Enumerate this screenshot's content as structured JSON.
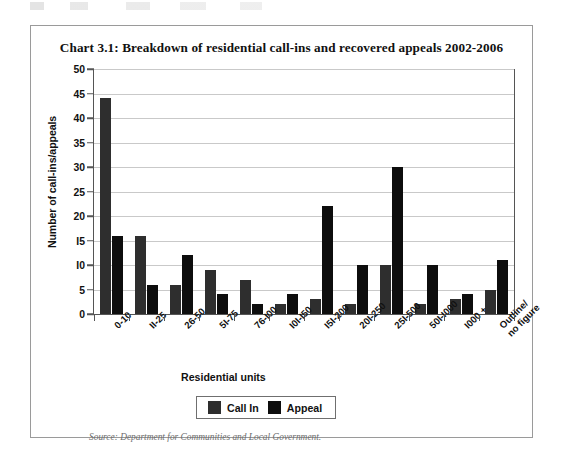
{
  "chart_data": {
    "type": "bar",
    "title": "Chart 3.1: Breakdown of residential call-ins and recovered appeals 2002-2006",
    "xlabel": "Residential units",
    "ylabel": "Number of call-ins/appeals",
    "ylim": [
      0,
      50
    ],
    "ytick_step": 5,
    "yticks": [
      0,
      5,
      10,
      15,
      20,
      25,
      30,
      35,
      40,
      45,
      50
    ],
    "ytick_labels": [
      "0",
      "5",
      "I0",
      "I5",
      "20",
      "25",
      "30",
      "35",
      "40",
      "45",
      "50"
    ],
    "grid": true,
    "legend_position": "bottom-center",
    "categories": [
      "0-10",
      "II-25",
      "26-50",
      "5I-75",
      "76-I00",
      "I0I-I50",
      "I5I-200",
      "20I-250",
      "25I-500",
      "50I-I000",
      "I000 +",
      "Outline/\nno figure"
    ],
    "series": [
      {
        "name": "Call In",
        "color": "#2e2e2e",
        "values": [
          44,
          16,
          6,
          9,
          7,
          2,
          3,
          2,
          10,
          2,
          3,
          5
        ]
      },
      {
        "name": "Appeal",
        "color": "#0d0d0d",
        "values": [
          16,
          6,
          12,
          4,
          2,
          4,
          22,
          10,
          30,
          10,
          4,
          11
        ]
      }
    ],
    "source": "Source: Department for Communities and Local Government."
  },
  "legend": {
    "items": [
      {
        "label": "Call In",
        "swatch": "callin"
      },
      {
        "label": "Appeal",
        "swatch": "appeal"
      }
    ]
  }
}
